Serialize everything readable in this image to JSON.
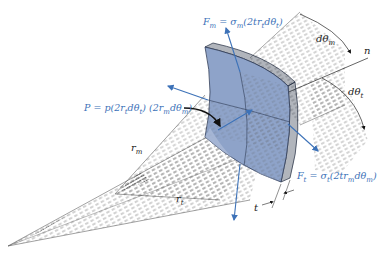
{
  "figure": {
    "colors": {
      "element_fill": "#8ea3c9",
      "element_edge": "#3a4a66",
      "force_arrow": "#3d72b8",
      "label_blue": "#3d72b8",
      "hatch_lines": "#444444"
    },
    "labels": {
      "Fm": "F",
      "Fm_sub": "m",
      "Fm_eq": " = σ",
      "Fm_eq_sub": "m",
      "Fm_rest": "(2tr",
      "Fm_rest_sub": "t",
      "Fm_tail": "dθ",
      "Fm_tail_sub": "t",
      "Fm_close": ")",
      "P": "P = p(2r",
      "P_sub1": "t",
      "P_mid": "dθ",
      "P_sub2": "t",
      "P_mid2": ") (2r",
      "P_sub3": "m",
      "P_mid3": "dθ",
      "P_sub4": "m",
      "P_close": ")",
      "Ft": "F",
      "Ft_sub": "t",
      "Ft_eq": " = σ",
      "Ft_eq_sub": "t",
      "Ft_rest": "(2tr",
      "Ft_rest_sub": "m",
      "Ft_tail": "dθ",
      "Ft_tail_sub": "m",
      "Ft_close": ")",
      "dtheta_m": "dθ",
      "dtheta_m_sub": "m",
      "dtheta_t": "dθ",
      "dtheta_t_sub": "t",
      "n": "n",
      "r_m": "r",
      "r_m_sub": "m",
      "r_t": "r",
      "r_t_sub": "t",
      "t": "t"
    }
  }
}
